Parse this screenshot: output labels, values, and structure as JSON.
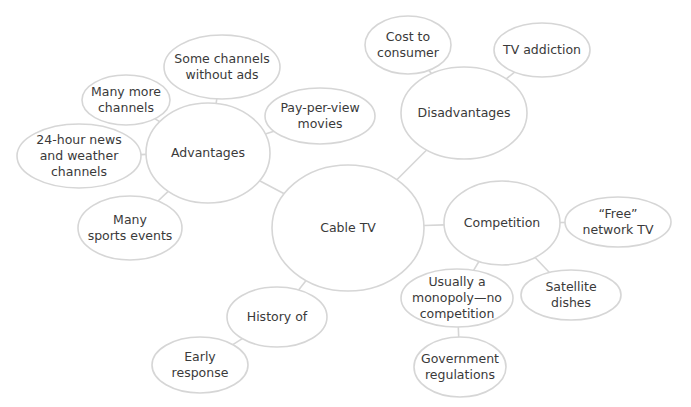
{
  "diagram": {
    "type": "mind-map",
    "colors": {
      "background": "#ffffff",
      "stroke": "#d6d6d6",
      "text": "#3a3a3a"
    },
    "nodes": [
      {
        "id": "cable-tv",
        "lines": [
          "Cable TV"
        ],
        "level": "root"
      },
      {
        "id": "advantages",
        "lines": [
          "Advantages"
        ],
        "level": "branch"
      },
      {
        "id": "some-channels-without-ads",
        "lines": [
          "Some channels",
          "without ads"
        ],
        "level": "leaf"
      },
      {
        "id": "many-more-channels",
        "lines": [
          "Many more",
          "channels"
        ],
        "level": "leaf"
      },
      {
        "id": "pay-per-view-movies",
        "lines": [
          "Pay-per-view",
          "movies"
        ],
        "level": "leaf"
      },
      {
        "id": "news-weather-channels",
        "lines": [
          "24-hour news",
          "and weather",
          "channels"
        ],
        "level": "leaf"
      },
      {
        "id": "many-sports-events",
        "lines": [
          "Many",
          "sports events"
        ],
        "level": "leaf"
      },
      {
        "id": "disadvantages",
        "lines": [
          "Disadvantages"
        ],
        "level": "branch"
      },
      {
        "id": "cost-to-consumer",
        "lines": [
          "Cost to",
          "consumer"
        ],
        "level": "leaf"
      },
      {
        "id": "tv-addiction",
        "lines": [
          "TV addiction"
        ],
        "level": "leaf"
      },
      {
        "id": "competition",
        "lines": [
          "Competition"
        ],
        "level": "branch"
      },
      {
        "id": "free-network-tv",
        "lines": [
          "“Free”",
          "network TV"
        ],
        "level": "leaf"
      },
      {
        "id": "satellite-dishes",
        "lines": [
          "Satellite",
          "dishes"
        ],
        "level": "leaf"
      },
      {
        "id": "usually-a-monopoly",
        "lines": [
          "Usually a",
          "monopoly—no",
          "competition"
        ],
        "level": "leaf"
      },
      {
        "id": "government-regulations",
        "lines": [
          "Government",
          "regulations"
        ],
        "level": "leaf"
      },
      {
        "id": "history-of",
        "lines": [
          "History of"
        ],
        "level": "branch"
      },
      {
        "id": "early-response",
        "lines": [
          "Early",
          "response"
        ],
        "level": "leaf"
      }
    ],
    "edges": [
      {
        "from": "cable-tv",
        "to": "advantages"
      },
      {
        "from": "cable-tv",
        "to": "disadvantages"
      },
      {
        "from": "cable-tv",
        "to": "competition"
      },
      {
        "from": "cable-tv",
        "to": "history-of"
      },
      {
        "from": "advantages",
        "to": "some-channels-without-ads"
      },
      {
        "from": "advantages",
        "to": "many-more-channels"
      },
      {
        "from": "advantages",
        "to": "pay-per-view-movies"
      },
      {
        "from": "advantages",
        "to": "news-weather-channels"
      },
      {
        "from": "advantages",
        "to": "many-sports-events"
      },
      {
        "from": "disadvantages",
        "to": "cost-to-consumer"
      },
      {
        "from": "disadvantages",
        "to": "tv-addiction"
      },
      {
        "from": "competition",
        "to": "free-network-tv"
      },
      {
        "from": "competition",
        "to": "satellite-dishes"
      },
      {
        "from": "competition",
        "to": "usually-a-monopoly"
      },
      {
        "from": "usually-a-monopoly",
        "to": "government-regulations"
      },
      {
        "from": "history-of",
        "to": "early-response"
      }
    ]
  }
}
